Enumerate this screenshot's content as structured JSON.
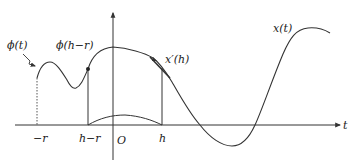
{
  "diagram": {
    "type": "function-plot-illustration",
    "stroke_color": "#333333",
    "background": "#ffffff",
    "labels": {
      "phi_t": "ϕ(t)",
      "phi_h_minus_r": "ϕ(h−r)",
      "x_prime_h": "x′(h)",
      "x_t": "x(t)",
      "axis_t": "t",
      "tick_minus_r": "−r",
      "tick_h_minus_r": "h−r",
      "tick_origin": "O",
      "tick_h": "h"
    },
    "axes": {
      "horizontal": "t",
      "vertical_arrow": true
    },
    "markers": {
      "point_at_h_minus_r": "filled dot on curve at h−r",
      "tangent_at_h": "tangent arrow at h labelled x′(h)"
    }
  }
}
